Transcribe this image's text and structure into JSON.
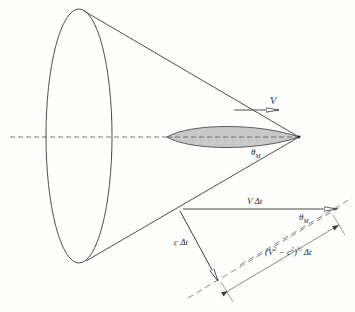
{
  "diagram": {
    "colors": {
      "line": "#3a3a3a",
      "body_fill": "#c8c8c8",
      "background": "#fefefc"
    },
    "labels": {
      "velocity": "V",
      "mach_angle_top": "θ",
      "mach_angle_top_sub": "M",
      "v_dt": "V Δt",
      "mach_angle_bottom": "θ",
      "mach_angle_bottom_sub": "M",
      "c_dt": "c Δt",
      "distance_prefix": "(V",
      "distance_sup1": "2",
      "distance_mid": " − c",
      "distance_sup2": "2",
      "distance_close": ")",
      "distance_exp": "½",
      "distance_suffix": " Δt"
    },
    "elements": [
      "cone-base-ellipse",
      "cone-generator-upper",
      "cone-generator-lower",
      "symmetry-axis-dashed",
      "slender-body",
      "velocity-arrow",
      "v-dt-vector",
      "c-dt-vector",
      "wavefront-dashed-line-1",
      "wavefront-dashed-line-2",
      "dimension-line"
    ]
  }
}
